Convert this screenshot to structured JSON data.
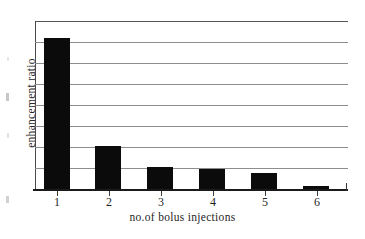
{
  "chart_data": {
    "type": "bar",
    "title": "",
    "subtitle": "",
    "xlabel": "no.of bolus injections",
    "ylabel": "enhancement ratio",
    "categories": [
      "1",
      "2",
      "3",
      "4",
      "5",
      "6"
    ],
    "values": [
      7.2,
      2.05,
      1.05,
      0.95,
      0.75,
      0.15
    ],
    "series": [
      {
        "name": "enhancement ratio",
        "values": [
          7.2,
          2.05,
          1.05,
          0.95,
          0.75,
          0.15
        ]
      }
    ],
    "xlim": [
      0.4,
      6.6
    ],
    "ylim": [
      0,
      8
    ],
    "y_gridline_values": [
      1,
      2,
      3,
      4,
      5,
      6,
      7,
      8
    ],
    "y_tick_labels": [],
    "grid": "horizontal",
    "legend": "none",
    "bar_color": "#0b0b0b",
    "gridline_color": "#8d8d8d",
    "axis_color": "#1a1a1a",
    "background_color": "#ffffff",
    "annotations": []
  },
  "figure": {
    "ylabel": "enhancement ratio",
    "xlabel": "no.of bolus injections",
    "xtick_labels": [
      "1",
      "2",
      "3",
      "4",
      "5",
      "6"
    ]
  }
}
